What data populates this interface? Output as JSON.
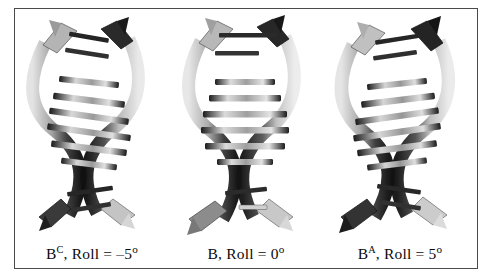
{
  "figure": {
    "background_color": "#ffffff",
    "border_color": "#4a4a4a",
    "panels": [
      {
        "id": "panel-bc",
        "label": {
          "base": "B",
          "superscript": "C",
          "separator": ", Roll = ",
          "value": "–5",
          "degree": "o",
          "full_text": "BC, Roll = –5o"
        },
        "structure": {
          "name": "B-DNA C-form variant",
          "roll_degrees": -5,
          "base_pair_tilt": "down-to-the-right",
          "backbone_style": "ribbon-with-arrowheads",
          "render": "grayscale-3d"
        }
      },
      {
        "id": "panel-b",
        "label": {
          "base": "B",
          "superscript": "",
          "separator": ", Roll = ",
          "value": "0",
          "degree": "o",
          "full_text": "B, Roll = 0o"
        },
        "structure": {
          "name": "B-DNA canonical",
          "roll_degrees": 0,
          "base_pair_tilt": "horizontal",
          "backbone_style": "ribbon-with-arrowheads",
          "render": "grayscale-3d"
        }
      },
      {
        "id": "panel-ba",
        "label": {
          "base": "B",
          "superscript": "A",
          "separator": ", Roll = ",
          "value": "5",
          "degree": "o",
          "full_text": "BA, Roll = 5o"
        },
        "structure": {
          "name": "B-DNA A-form variant",
          "roll_degrees": 5,
          "base_pair_tilt": "up-to-the-right",
          "backbone_style": "ribbon-with-arrowheads",
          "render": "grayscale-3d"
        }
      }
    ]
  },
  "colors": {
    "ribbon_dark": "#1c1c1c",
    "ribbon_mid": "#6e6e6e",
    "ribbon_light": "#d2d2d2",
    "base_dark": "#202020",
    "base_light": "#c9c9c9",
    "text": "#0a0a0a"
  }
}
